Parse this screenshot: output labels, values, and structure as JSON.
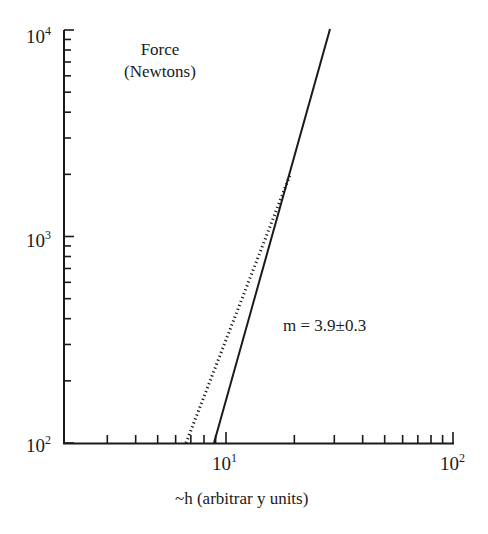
{
  "chart_data": {
    "type": "line",
    "title": "",
    "annotation_title": [
      "Force",
      "(Newtons)"
    ],
    "xlabel": "~h (arbitrar y units)",
    "ylabel": "Force (Newtons)",
    "xscale": "log",
    "yscale": "log",
    "xlim": [
      1.93,
      100
    ],
    "ylim": [
      100,
      10000
    ],
    "x_tick_labels": [
      "10^1",
      "10^2"
    ],
    "y_tick_labels": [
      "10^2",
      "10^3",
      "10^4"
    ],
    "grid": false,
    "series": [
      {
        "name": "fit",
        "style": "solid",
        "x": [
          8.8,
          29.5
        ],
        "y": [
          100,
          10000
        ]
      },
      {
        "name": "data",
        "style": "dotted",
        "x": [
          6.8,
          18.5
        ],
        "y": [
          100,
          2000
        ]
      }
    ],
    "annotations": [
      {
        "text": "m = 3.9±0.3",
        "x": 21,
        "y": 300
      }
    ]
  },
  "labels": {
    "force": "Force",
    "newtons": "(Newtons)",
    "slope": "m = 3.9±0.3",
    "xlabel": "~h (arbitrar y units)",
    "y1e2_base": "10",
    "y1e2_exp": "2",
    "y1e3_base": "10",
    "y1e3_exp": "3",
    "y1e4_base": "10",
    "y1e4_exp": "4",
    "x1e1_base": "10",
    "x1e1_exp": "1",
    "x1e2_base": "10",
    "x1e2_exp": "2"
  }
}
